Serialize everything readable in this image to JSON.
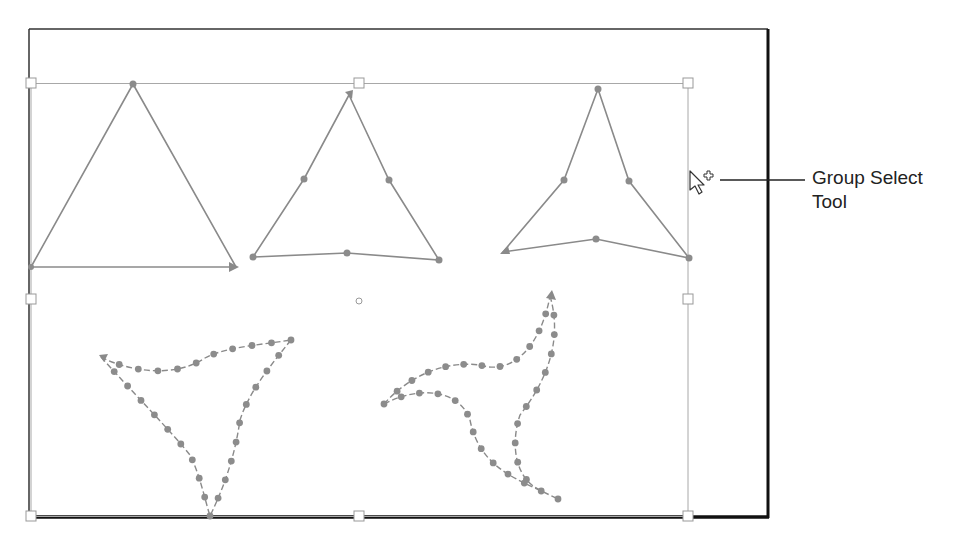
{
  "figure": {
    "callout": {
      "line1": "Group Select",
      "line2": "Tool"
    },
    "cursor": {
      "icon": "group-select-cursor-icon"
    },
    "colors": {
      "artboard_border": "#1a1a1a",
      "selection_box": "#9a9a9a",
      "path_stroke": "#8a8a8a",
      "anchor_point": "#8c8c8c",
      "handle_fill": "#ffffff",
      "callout_line": "#222222",
      "label_text": "#222222"
    },
    "shapes": [
      {
        "name": "triangle-plain",
        "anchors": 3
      },
      {
        "name": "triangle-with-midpoints",
        "anchors": 6
      },
      {
        "name": "triangle-pinched",
        "anchors": 6
      },
      {
        "name": "triangle-twisted-dotted",
        "style": "dashed-with-many-anchors"
      },
      {
        "name": "triangle-swirl-dotted",
        "style": "dashed-with-many-anchors"
      }
    ]
  }
}
